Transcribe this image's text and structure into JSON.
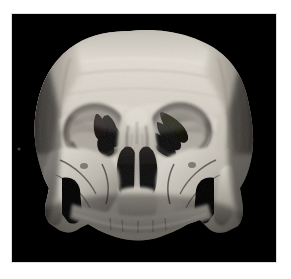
{
  "image": {
    "kind": "medical-3d-volume-rendering",
    "modality": "CT",
    "subject": "human skull",
    "view": "anterior (frontal) face view",
    "colormap": "grayscale",
    "background_color": "#000000",
    "page_background_color": "#ffffff",
    "canvas": {
      "x": 12,
      "y": 14,
      "width": 264,
      "height": 248
    },
    "tone": {
      "bone_highlight": "#e8e4dc",
      "bone_midtone": "#b5b0a6",
      "bone_shadow": "#6d6862",
      "cavity_dark": "#0a0a0a",
      "soft_shadow": "#3a3733"
    }
  },
  "anatomy": {
    "regions": [
      {
        "name": "calvaria",
        "label": "Cranial vault (frontal bone)",
        "note": "truncated superiorly by scan volume boundary"
      },
      {
        "name": "slice-boundary-line",
        "label": "Scan volume cut edge",
        "note": "horizontal banding across frontal bone"
      },
      {
        "name": "supraorbital-ridge",
        "label": "Supraorbital ridge"
      },
      {
        "name": "orbit-right",
        "label": "Right orbit (viewer left)"
      },
      {
        "name": "orbit-left",
        "label": "Left orbit (viewer right)"
      },
      {
        "name": "superior-orbital-fissure",
        "label": "Orbital fissures",
        "note": "dark finger-like streaks within orbits"
      },
      {
        "name": "nasal-bridge",
        "label": "Nasal bridge / glabella"
      },
      {
        "name": "nasal-aperture",
        "label": "Piriform (nasal) aperture"
      },
      {
        "name": "nasal-septum",
        "label": "Nasal septum / vomer"
      },
      {
        "name": "zygomatic-arch-right",
        "label": "Right zygomatic arch"
      },
      {
        "name": "zygomatic-arch-left",
        "label": "Left zygomatic arch"
      },
      {
        "name": "maxilla",
        "label": "Maxilla / alveolar process"
      },
      {
        "name": "temporal-bone-right",
        "label": "Right temporal region"
      },
      {
        "name": "temporal-bone-left",
        "label": "Left temporal region"
      },
      {
        "name": "artifact-speck",
        "label": "Small reconstruction speck",
        "x": 18,
        "y": 149
      }
    ]
  },
  "annotations": {
    "visible_text": [],
    "overlay_labels": [],
    "scale_bar": null,
    "note": "No text, axes, ticks, legend, or UI chrome appear in the screenshot."
  }
}
